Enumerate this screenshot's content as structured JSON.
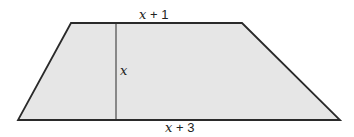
{
  "diagram": {
    "shape": "trapezoid",
    "fill_color": "#e6e6e6",
    "stroke_color": "#2a2a2a",
    "vertices": {
      "top_left": [
        71,
        23
      ],
      "top_right": [
        242,
        23
      ],
      "bottom_right": [
        340,
        120
      ],
      "bottom_left": [
        18,
        120
      ]
    },
    "height_line": {
      "x": 116,
      "y1": 23,
      "y2": 120
    },
    "labels": {
      "top_base": {
        "var": "x",
        "rest": " + 1"
      },
      "bottom_base": {
        "var": "x",
        "rest": " + 3"
      },
      "height": {
        "var": "x"
      }
    }
  }
}
